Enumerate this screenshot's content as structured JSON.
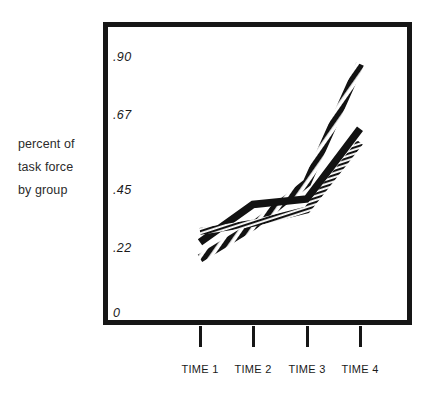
{
  "figure": {
    "axis_caption_lines": [
      "percent of",
      "task force",
      "by group"
    ],
    "frame_color": "#161616",
    "background": "#ffffff"
  },
  "chart_data": {
    "type": "line",
    "title": "",
    "xlabel": "",
    "ylabel": "percent of task force by group",
    "categories": [
      "TIME 1",
      "TIME 2",
      "TIME 3",
      "TIME 4"
    ],
    "x": [
      1,
      2,
      3,
      4
    ],
    "ylim": [
      0,
      1.0
    ],
    "ytick_values": [
      0,
      0.22,
      0.45,
      0.67,
      0.9
    ],
    "ytick_labels": [
      "0",
      ".22",
      ".45",
      ".67",
      ".90"
    ],
    "grid": false,
    "legend": "none",
    "series": [
      {
        "name": "group-striped",
        "style": "diagonal-striped",
        "values": [
          0.18,
          0.3,
          0.46,
          0.9
        ]
      },
      {
        "name": "group-solid",
        "style": "solid-black",
        "values": [
          0.24,
          0.38,
          0.4,
          0.66
        ]
      },
      {
        "name": "group-hatched",
        "style": "fine-hatched",
        "values": [
          0.28,
          0.31,
          0.36,
          0.61
        ]
      }
    ]
  },
  "axis": {
    "y_ticks": [
      {
        "label": ".90",
        "top": 50
      },
      {
        "label": ".67",
        "top": 108
      },
      {
        "label": ".45",
        "top": 183
      },
      {
        "label": ".22",
        "top": 241
      },
      {
        "label": "0",
        "top": 306
      }
    ],
    "x_ticks": [
      {
        "label": "TIME 1",
        "x": 200
      },
      {
        "label": "TIME 2",
        "x": 253
      },
      {
        "label": "TIME 3",
        "x": 307
      },
      {
        "label": "TIME 4",
        "x": 360
      }
    ]
  }
}
